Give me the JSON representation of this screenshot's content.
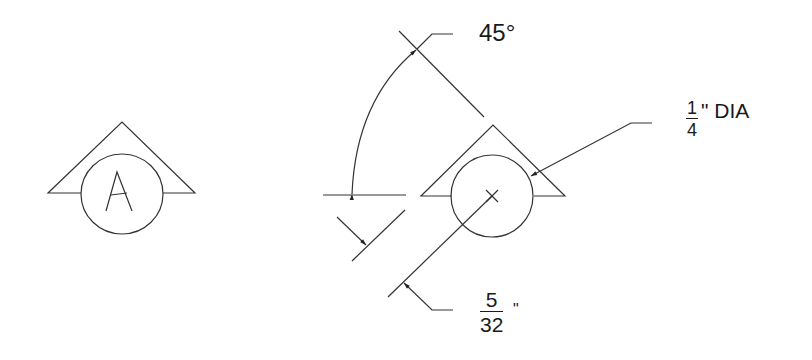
{
  "diagram": {
    "type": "section-cut-symbol-detail",
    "symbol_example": {
      "letter": "A"
    },
    "dimensions": {
      "angle": {
        "label": "45°"
      },
      "diameter": {
        "numerator": "1",
        "denominator": "4",
        "suffix": "\" DIA"
      },
      "offset": {
        "numerator": "5",
        "denominator": "32",
        "suffix": "\""
      }
    },
    "colors": {
      "line": "#333333",
      "text": "#1a1a1a",
      "background": "#ffffff"
    }
  }
}
